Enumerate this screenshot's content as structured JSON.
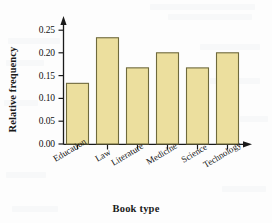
{
  "chart_data": {
    "type": "bar",
    "title": "",
    "xlabel": "Book type",
    "ylabel": "Relative frequency",
    "categories": [
      "Education",
      "Law",
      "Literature",
      "Medicine",
      "Science",
      "Technology"
    ],
    "values": [
      0.167,
      0.1,
      0.133,
      0.233,
      0.167,
      0.2
    ],
    "ylim": [
      0.0,
      0.25
    ],
    "ytick_labels": [
      "0.00",
      "0.05",
      "0.10",
      "0.15",
      "0.20",
      "0.25"
    ],
    "ytick_values": [
      0.0,
      0.05,
      0.1,
      0.15,
      0.2,
      0.25
    ],
    "grid": false,
    "legend": "none",
    "bar_fill_color": "#ecdf9e",
    "bar_edge_color": "#6f6a3c",
    "axis_color": "#1a1a1a",
    "background_color": "#fdfdfd",
    "axis_arrows": true,
    "category_label_rotation_deg": -31
  }
}
